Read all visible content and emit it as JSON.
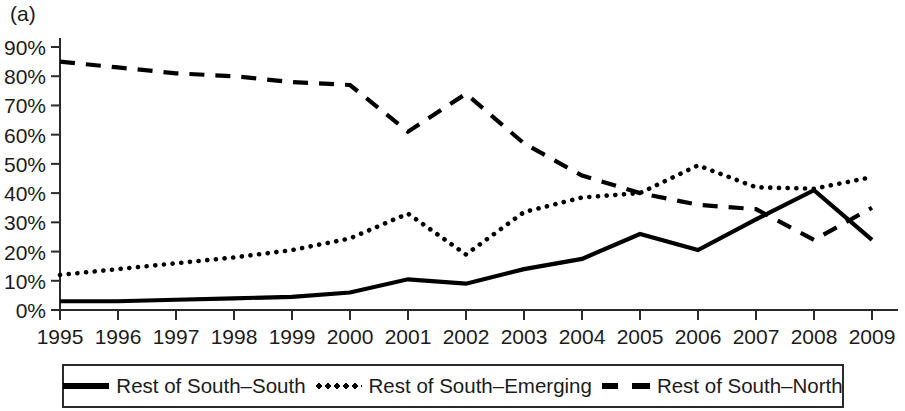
{
  "panel": {
    "label": "(a)"
  },
  "chart_data": {
    "type": "line",
    "title": "",
    "subtitle": "",
    "xlabel": "",
    "ylabel": "",
    "grid": false,
    "legend_position": "bottom",
    "xlim": [
      1995,
      2009
    ],
    "ylim": [
      0,
      90
    ],
    "categories": [
      "1995",
      "1996",
      "1997",
      "1998",
      "1999",
      "2000",
      "2001",
      "2002",
      "2003",
      "2004",
      "2005",
      "2006",
      "2007",
      "2008",
      "2009"
    ],
    "x": [
      1995,
      1996,
      1997,
      1998,
      1999,
      2000,
      2001,
      2002,
      2003,
      2004,
      2005,
      2006,
      2007,
      2008,
      2009
    ],
    "ytick_labels": [
      "0%",
      "10%",
      "20%",
      "30%",
      "40%",
      "50%",
      "60%",
      "70%",
      "80%",
      "90%"
    ],
    "ytick_values": [
      0,
      10,
      20,
      30,
      40,
      50,
      60,
      70,
      80,
      90
    ],
    "xtick_labels": [
      "1995",
      "1996",
      "1997",
      "1998",
      "1999",
      "2000",
      "2001",
      "2002",
      "2003",
      "2004",
      "2005",
      "2006",
      "2007",
      "2008",
      "2009"
    ],
    "series": [
      {
        "name": "Rest of South–South",
        "style": "solid",
        "color": "#000000",
        "values": [
          3,
          3,
          3.5,
          4,
          4.5,
          6,
          10.5,
          9,
          14,
          17.5,
          26,
          20.5,
          31,
          41,
          24
        ]
      },
      {
        "name": "Rest of South–Emerging",
        "style": "dotted",
        "color": "#000000",
        "values": [
          12,
          14,
          16,
          18,
          20.5,
          24.5,
          33,
          19,
          33.5,
          38.5,
          40,
          49.5,
          42,
          41.5,
          45.5
        ]
      },
      {
        "name": "Rest of South–North",
        "style": "dashed",
        "color": "#000000",
        "values": [
          85,
          83,
          81,
          80,
          78,
          77,
          61,
          74,
          57,
          46,
          40,
          36,
          34.5,
          24,
          35
        ]
      }
    ]
  },
  "legend": {
    "entries": [
      {
        "label": "Rest of South–South",
        "style": "solid"
      },
      {
        "label": "Rest of South–Emerging",
        "style": "dotted"
      },
      {
        "label": "Rest of South–North",
        "style": "dashed"
      }
    ]
  }
}
